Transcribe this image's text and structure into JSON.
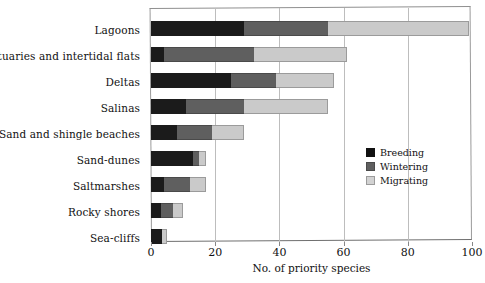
{
  "chart_data": {
    "type": "bar",
    "orientation": "horizontal",
    "stacked": true,
    "title": "",
    "xlabel": "No. of priority species",
    "ylabel": "",
    "xlim": [
      0,
      100
    ],
    "ylim": null,
    "grid": "vertical",
    "xticks": [
      0,
      20,
      40,
      60,
      80,
      100
    ],
    "xtick_labels": [
      "0",
      "20",
      "40",
      "60",
      "80",
      "100"
    ],
    "legend_position": "center-right",
    "categories": [
      "Lagoons",
      "Estuaries and intertidal flats",
      "Deltas",
      "Salinas",
      "Sand and shingle beaches",
      "Sand-dunes",
      "Saltmarshes",
      "Rocky shores",
      "Sea-cliffs"
    ],
    "series": [
      {
        "name": "Breeding",
        "color": "#1b1b1b",
        "values": [
          29,
          4,
          25,
          11,
          8,
          13,
          4,
          3,
          3.5
        ]
      },
      {
        "name": "Wintering",
        "color": "#5f5f5f",
        "values": [
          26,
          28,
          14,
          18,
          11,
          2,
          8,
          4,
          0
        ]
      },
      {
        "name": "Migrating",
        "color": "#cacaca",
        "values": [
          44,
          29,
          18,
          26,
          10,
          2,
          5,
          3,
          1.5
        ]
      }
    ],
    "totals": [
      99,
      61,
      57,
      55,
      29,
      17,
      17,
      10,
      5
    ]
  },
  "legend": {
    "items": [
      {
        "label": "Breeding",
        "color": "#111111"
      },
      {
        "label": "Wintering",
        "color": "#5f5f5f"
      },
      {
        "label": "Migrating",
        "color": "#d2d2d2"
      }
    ]
  }
}
